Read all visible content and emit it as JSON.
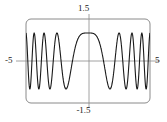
{
  "figure": {
    "name": "chirp-function-plot",
    "width": 167,
    "height": 122,
    "background_color": "#ffffff"
  },
  "labels": {
    "y_max": "1.5",
    "y_min": "-1.5",
    "x_min": "-5",
    "x_max": "5"
  },
  "style": {
    "frame_color": "#8a8a8a",
    "axis_color": "#8a8a8a",
    "curve_color": "#1a1a1a",
    "text_color": "#1a1a1a",
    "frame_stroke_width": 1,
    "axis_stroke_width": 0.8,
    "curve_stroke_width": 1.1,
    "frame_corner_radius": 5
  },
  "geometry": {
    "frame_left": 26,
    "frame_top": 19,
    "frame_right": 150,
    "frame_bottom": 103,
    "origin_x": 89,
    "origin_y": 61,
    "axis_x_start": 16,
    "axis_x_end": 160,
    "axis_y_start": 14,
    "axis_y_end": 108
  },
  "chart_data": {
    "type": "line",
    "title": "",
    "subtitle": "",
    "xlabel": "",
    "ylabel": "",
    "xlim": [
      -5,
      5
    ],
    "ylim": [
      -1.5,
      1.5
    ],
    "xticks": [
      -5,
      5
    ],
    "xticklabels": [
      "-5",
      "5"
    ],
    "yticks": [
      -1.5,
      1.5
    ],
    "yticklabels": [
      "-1.5",
      "1.5"
    ],
    "grid": false,
    "legend": null,
    "axes_style": "centered-crosshair-with-rounded-frame",
    "series": [
      {
        "name": "y = cos(x^2)",
        "expression": "cos(x*x)",
        "color": "#1a1a1a",
        "amplitude": 1.0,
        "x": [
          -5.0,
          -4.9,
          -4.8,
          -4.7,
          -4.6,
          -4.5,
          -4.4,
          -4.3,
          -4.2,
          -4.1,
          -4.0,
          -3.9,
          -3.8,
          -3.7,
          -3.6,
          -3.5,
          -3.4,
          -3.3,
          -3.2,
          -3.1,
          -3.0,
          -2.9,
          -2.8,
          -2.7,
          -2.6,
          -2.5,
          -2.4,
          -2.3,
          -2.2,
          -2.1,
          -2.0,
          -1.9,
          -1.8,
          -1.7,
          -1.6,
          -1.5,
          -1.4,
          -1.3,
          -1.2,
          -1.1,
          -1.0,
          -0.9,
          -0.8,
          -0.7,
          -0.6,
          -0.5,
          -0.4,
          -0.3,
          -0.2,
          -0.1,
          0.0,
          0.1,
          0.2,
          0.3,
          0.4,
          0.5,
          0.6,
          0.7,
          0.8,
          0.9,
          1.0,
          1.1,
          1.2,
          1.3,
          1.4,
          1.5,
          1.6,
          1.7,
          1.8,
          1.9,
          2.0,
          2.1,
          2.2,
          2.3,
          2.4,
          2.5,
          2.6,
          2.7,
          2.8,
          2.9,
          3.0,
          3.1,
          3.2,
          3.3,
          3.4,
          3.5,
          3.6,
          3.7,
          3.8,
          3.9,
          4.0,
          4.1,
          4.2,
          4.3,
          4.4,
          4.5,
          4.6,
          4.7,
          4.8,
          4.9,
          5.0
        ],
        "y": [
          0.991,
          0.664,
          0.101,
          -0.501,
          -0.916,
          -0.987,
          -0.703,
          -0.158,
          0.452,
          0.895,
          0.992,
          0.747,
          0.226,
          -0.384,
          -0.862,
          -0.998,
          -0.795,
          -0.303,
          0.308,
          0.808,
          0.999,
          0.852,
          0.402,
          -0.206,
          -0.743,
          -0.992,
          -0.909,
          -0.509,
          0.072,
          0.64,
          0.976,
          0.953,
          0.617,
          0.03,
          -0.556,
          -0.946,
          -0.988,
          -0.736,
          -0.234,
          0.356,
          0.84,
          0.965,
          0.8,
          0.373,
          -0.18,
          -0.684,
          -0.958,
          -0.944,
          -0.696,
          -0.236,
          0.25,
          0.679,
          0.942,
          0.993,
          0.859,
          0.585,
          0.235,
          -0.122,
          -0.429,
          -0.66,
          -0.809,
          -0.888,
          -0.919,
          -0.925,
          -0.925,
          -0.928,
          -0.935,
          -0.938,
          -0.921,
          -0.863,
          -0.745,
          -0.557,
          -0.304,
          -0.011,
          0.288,
          0.555,
          0.762,
          0.897,
          0.962,
          0.967,
          0.924,
          0.841,
          0.721,
          0.561,
          0.358,
          0.113,
          -0.159,
          -0.432,
          -0.671,
          -0.847,
          -0.946,
          -0.969,
          -0.927,
          -0.834,
          -0.7,
          -0.53,
          -0.324,
          -0.083,
          0.186,
          0.461,
          0.705
        ]
      }
    ],
    "annotations": [
      {
        "text": "1.5",
        "position": "top-center",
        "axis": "y",
        "value": 1.5
      },
      {
        "text": "-1.5",
        "position": "bottom-center",
        "axis": "y",
        "value": -1.5
      },
      {
        "text": "-5",
        "position": "left",
        "axis": "x",
        "value": -5
      },
      {
        "text": "5",
        "position": "right",
        "axis": "x",
        "value": 5
      }
    ]
  }
}
